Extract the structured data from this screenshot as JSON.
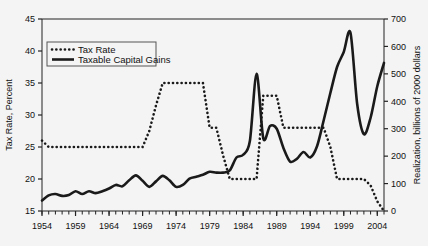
{
  "chart_data": {
    "type": "line",
    "title": "",
    "subtitle": "",
    "xlabel": "",
    "ylabel": "Tax Rate, Percent",
    "y2label": "Realization, billions of 2000 dollars",
    "xlim": [
      1954,
      2005
    ],
    "ylim": [
      15,
      45
    ],
    "y2lim": [
      0,
      700
    ],
    "grid": false,
    "legend_position": "top-left",
    "x_tick_labels": [
      "1954",
      "1959",
      "1964",
      "1969",
      "1974",
      "1979",
      "1984",
      "1989",
      "1994",
      "1999",
      "2004"
    ],
    "x_tick_values": [
      1954,
      1959,
      1964,
      1969,
      1974,
      1979,
      1984,
      1989,
      1994,
      1999,
      2004
    ],
    "x_minor_tick_step": 1,
    "y_tick_labels": [
      "15",
      "20",
      "25",
      "30",
      "35",
      "40",
      "45"
    ],
    "y_tick_values": [
      15,
      20,
      25,
      30,
      35,
      40,
      45
    ],
    "y2_tick_labels": [
      "0",
      "100",
      "200",
      "300",
      "400",
      "500",
      "600",
      "700"
    ],
    "y2_tick_values": [
      0,
      100,
      200,
      300,
      400,
      500,
      600,
      700
    ],
    "x": [
      1954,
      1955,
      1956,
      1957,
      1958,
      1959,
      1960,
      1961,
      1962,
      1963,
      1964,
      1965,
      1966,
      1967,
      1968,
      1969,
      1970,
      1971,
      1972,
      1973,
      1974,
      1975,
      1976,
      1977,
      1978,
      1979,
      1980,
      1981,
      1982,
      1983,
      1984,
      1985,
      1986,
      1987,
      1988,
      1989,
      1990,
      1991,
      1992,
      1993,
      1994,
      1995,
      1996,
      1997,
      1998,
      1999,
      2000,
      2001,
      2002,
      2003,
      2004,
      2005
    ],
    "series": [
      {
        "name": "Tax Rate",
        "axis": "left",
        "style": "dotted",
        "color": "#1a1a1a",
        "units": "percent",
        "values": [
          26.0,
          25.0,
          25.0,
          25.0,
          25.0,
          25.0,
          25.0,
          25.0,
          25.0,
          25.0,
          25.0,
          25.0,
          25.0,
          25.0,
          25.0,
          25.0,
          27.5,
          31.5,
          35.0,
          35.0,
          35.0,
          35.0,
          35.0,
          35.0,
          35.0,
          28.0,
          28.0,
          23.7,
          20.0,
          20.0,
          20.0,
          20.0,
          20.0,
          33.0,
          33.0,
          33.0,
          28.0,
          28.0,
          28.0,
          28.0,
          28.0,
          28.0,
          28.0,
          25.0,
          20.0,
          20.0,
          20.0,
          20.0,
          20.0,
          19.0,
          16.5,
          15.0
        ]
      },
      {
        "name": "Taxable Capital Gains",
        "axis": "right",
        "style": "solid",
        "color": "#1a1a1a",
        "units": "billions of 2000 dollars",
        "values": [
          38,
          57,
          62,
          55,
          58,
          72,
          62,
          72,
          65,
          72,
          82,
          95,
          90,
          112,
          130,
          110,
          88,
          108,
          128,
          112,
          88,
          95,
          118,
          125,
          132,
          143,
          140,
          140,
          148,
          195,
          205,
          255,
          500,
          265,
          310,
          300,
          230,
          180,
          190,
          215,
          195,
          235,
          330,
          430,
          525,
          580,
          650,
          390,
          280,
          340,
          455,
          540
        ]
      }
    ],
    "annotations": []
  },
  "legend": {
    "entries": [
      {
        "label": "Tax Rate",
        "style": "dotted"
      },
      {
        "label": "Taxable Capital Gains",
        "style": "solid"
      }
    ]
  },
  "axes": {
    "left_title": "Tax Rate, Percent",
    "right_title": "Realization, billions of 2000 dollars"
  }
}
